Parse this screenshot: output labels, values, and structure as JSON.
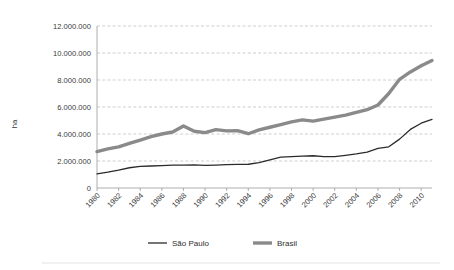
{
  "chart_data": {
    "type": "line",
    "title": "",
    "subtitle": "",
    "xlabel": "",
    "ylabel": "ha",
    "ylim": [
      0,
      12000000
    ],
    "xlim": [
      1980,
      2011
    ],
    "grid": true,
    "legend_position": "bottom",
    "y_ticks": [
      0,
      2000000,
      4000000,
      6000000,
      8000000,
      10000000,
      12000000
    ],
    "y_tick_labels": [
      "0",
      "2.000.000",
      "4.000.000",
      "6.000.000",
      "8.000.000",
      "10.000.000",
      "12.000.000"
    ],
    "x": [
      1980,
      1981,
      1982,
      1983,
      1984,
      1985,
      1986,
      1987,
      1988,
      1989,
      1990,
      1991,
      1992,
      1993,
      1994,
      1995,
      1996,
      1997,
      1998,
      1999,
      2000,
      2001,
      2002,
      2003,
      2004,
      2005,
      2006,
      2007,
      2008,
      2009,
      2010,
      2011
    ],
    "x_tick_labels": [
      "1980",
      "1982",
      "1984",
      "1986",
      "1988",
      "1990",
      "1992",
      "1994",
      "1996",
      "1998",
      "2000",
      "2002",
      "2004",
      "2006",
      "2008",
      "2010"
    ],
    "series": [
      {
        "name": "São Paulo",
        "color": "#2b2b2b",
        "width": 1.3,
        "values": [
          1050000,
          1180000,
          1330000,
          1500000,
          1600000,
          1630000,
          1660000,
          1690000,
          1700000,
          1710000,
          1680000,
          1700000,
          1730000,
          1750000,
          1760000,
          1880000,
          2080000,
          2280000,
          2330000,
          2360000,
          2390000,
          2330000,
          2330000,
          2420000,
          2520000,
          2660000,
          2930000,
          3050000,
          3620000,
          4340000,
          4800000,
          5080000
        ]
      },
      {
        "name": "Brasil",
        "color": "#8a8a8a",
        "width": 3.4,
        "values": [
          2700000,
          2900000,
          3050000,
          3300000,
          3550000,
          3800000,
          4000000,
          4150000,
          4600000,
          4200000,
          4100000,
          4320000,
          4230000,
          4250000,
          4020000,
          4300000,
          4500000,
          4700000,
          4900000,
          5050000,
          4950000,
          5100000,
          5250000,
          5400000,
          5600000,
          5800000,
          6150000,
          7000000,
          8050000,
          8600000,
          9050000,
          9450000
        ]
      }
    ]
  },
  "legend": {
    "items": [
      {
        "label": "São Paulo"
      },
      {
        "label": "Brasil"
      }
    ]
  }
}
